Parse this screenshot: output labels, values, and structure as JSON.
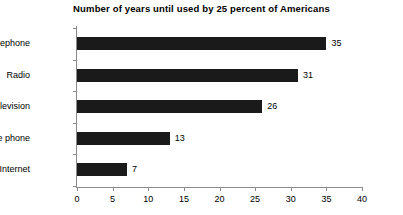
{
  "chart_data": {
    "type": "bar",
    "orientation": "horizontal",
    "title": "Number of years until used by 25 percent of Americans",
    "xlabel": "",
    "ylabel": "",
    "categories": [
      "Telephone",
      "Radio",
      "Television",
      "Mobile phone",
      "Internet"
    ],
    "values": [
      35,
      31,
      26,
      13,
      7
    ],
    "value_labels": [
      "35",
      "31",
      "26",
      "13",
      "7"
    ],
    "xlim": [
      0,
      40
    ],
    "xticks": [
      0,
      5,
      10,
      15,
      20,
      25,
      30,
      35,
      40
    ],
    "xtick_labels": [
      "0",
      "5",
      "10",
      "15",
      "20",
      "25",
      "30",
      "35",
      "40"
    ],
    "grid": false,
    "legend": null,
    "bar_color": "#1a1a1a",
    "axis_color": "#8a8a8a",
    "background_color": "#ffffff"
  }
}
